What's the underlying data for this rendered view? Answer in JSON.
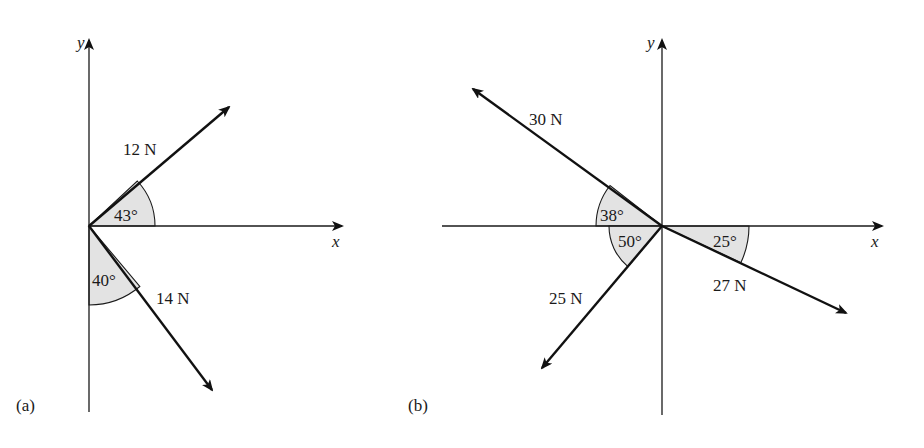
{
  "figure": {
    "panels": [
      {
        "id": "a",
        "label": "(a)",
        "axes": {
          "x_label": "x",
          "y_label": "y"
        },
        "forces": [
          {
            "label": "12 N",
            "magnitude_N": 12,
            "angle_label": "43°",
            "angle_deg": 43,
            "reference": "+x axis",
            "direction": "up-right"
          },
          {
            "label": "14 N",
            "magnitude_N": 14,
            "angle_label": "40°",
            "angle_deg": 40,
            "reference": "-y axis",
            "direction": "down-right"
          }
        ]
      },
      {
        "id": "b",
        "label": "(b)",
        "axes": {
          "x_label": "x",
          "y_label": "y"
        },
        "forces": [
          {
            "label": "30 N",
            "magnitude_N": 30,
            "angle_label": "38°",
            "angle_deg": 38,
            "reference": "-x axis",
            "direction": "up-left"
          },
          {
            "label": "25 N",
            "magnitude_N": 25,
            "angle_label": "50°",
            "angle_deg": 50,
            "reference": "-x axis",
            "direction": "down-left"
          },
          {
            "label": "27 N",
            "magnitude_N": 27,
            "angle_label": "25°",
            "angle_deg": 25,
            "reference": "+x axis",
            "direction": "down-right"
          }
        ]
      }
    ]
  },
  "colors": {
    "line": "#111111",
    "angle_fill": "#e3e3e3",
    "background": "#ffffff"
  }
}
